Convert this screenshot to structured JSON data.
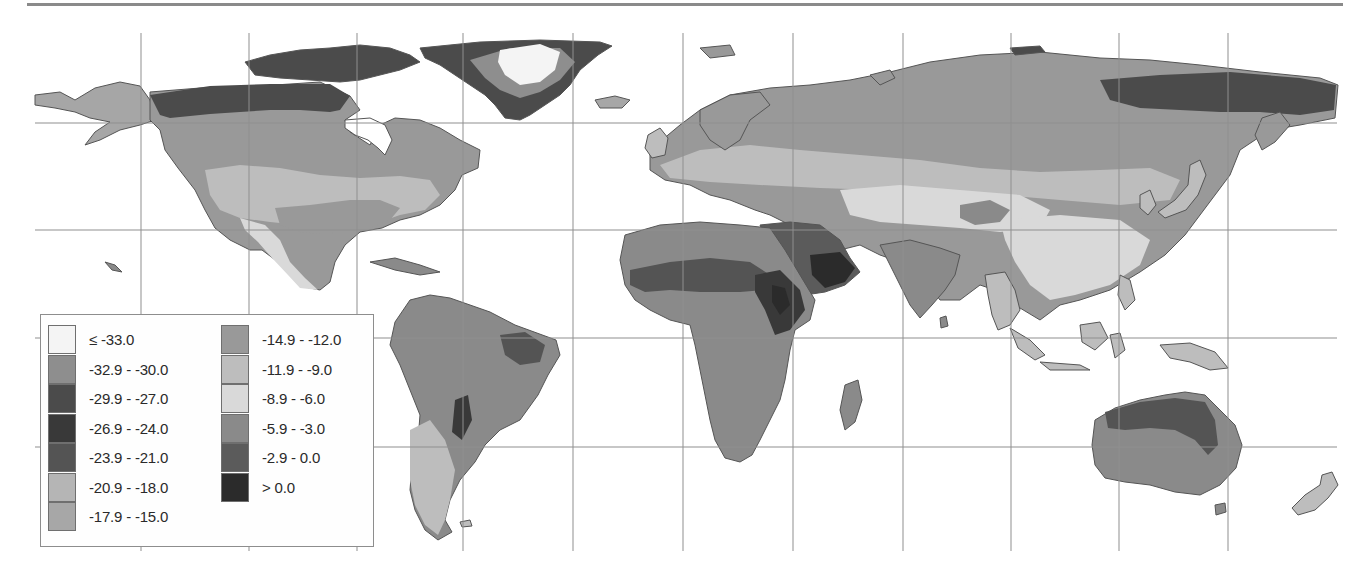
{
  "map": {
    "type": "choropleth world map (equirectangular)",
    "graticule": {
      "vertical_x_px": [
        141,
        249,
        357,
        463,
        573,
        683,
        793,
        903,
        1011,
        1119,
        1228
      ],
      "horizontal_y_px": [
        123,
        230,
        338,
        447
      ],
      "line_color": "#8f8f8f"
    },
    "colors": {
      "ocean": "#ffffff",
      "coastline": "#555555"
    }
  },
  "legend": {
    "column_1": [
      {
        "label": "≤ -33.0",
        "color": "#f4f4f4"
      },
      {
        "label": "-32.9 - -30.0",
        "color": "#8e8e8e"
      },
      {
        "label": "-29.9 - -27.0",
        "color": "#4b4b4b"
      },
      {
        "label": "-26.9 - -24.0",
        "color": "#393939"
      },
      {
        "label": "-23.9 - -21.0",
        "color": "#545454"
      },
      {
        "label": "-20.9 - -18.0",
        "color": "#b5b5b5"
      },
      {
        "label": "-17.9 - -15.0",
        "color": "#a7a7a7"
      }
    ],
    "column_2": [
      {
        "label": "-14.9 - -12.0",
        "color": "#999999"
      },
      {
        "label": "-11.9 - -9.0",
        "color": "#bdbdbd"
      },
      {
        "label": "-8.9 - -6.0",
        "color": "#d9d9d9"
      },
      {
        "label": "-5.9 - -3.0",
        "color": "#8a8a8a"
      },
      {
        "label": "-2.9 - 0.0",
        "color": "#5b5b5b"
      },
      {
        "label": "> 0.0",
        "color": "#2b2b2b"
      }
    ]
  }
}
